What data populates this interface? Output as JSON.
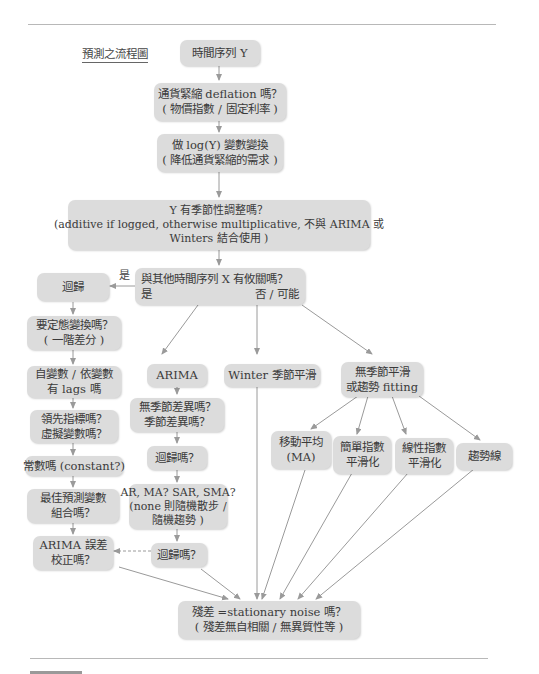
{
  "title": "預測之流程圖",
  "colors": {
    "box_fill": "#dcdcdc",
    "line": "#9a9a9a",
    "text": "#3a3a3a"
  },
  "nodes": {
    "start": {
      "lines": [
        "時間序列 Y"
      ]
    },
    "deflation": {
      "lines": [
        "通貨緊縮 deflation 嗎？",
        "( 物價指數 / 固定利率 )"
      ]
    },
    "log": {
      "lines": [
        "做 log(Y) 變數變換",
        "( 降低通貨緊縮的需求 )"
      ]
    },
    "seasonal": {
      "lines": [
        "Y 有季節性調整嗎？",
        "(additive if logged, otherwise multiplicative, 不與 ARIMA 或",
        "Winters 結合使用 )"
      ]
    },
    "related": {
      "line1": "與其他時間序列 X 有攸關嗎？",
      "yes": "是",
      "no": "否 / 可能"
    },
    "regression": {
      "lines": [
        "迴歸"
      ]
    },
    "stationary_transform": {
      "lines": [
        "要定態變換嗎？",
        "( 一階差分 )"
      ]
    },
    "lags": {
      "lines": [
        "自變數 / 依變數",
        "有 lags 嗎"
      ]
    },
    "leading": {
      "lines": [
        "領先指標嗎？",
        "虛擬變數嗎？"
      ]
    },
    "constant": {
      "lines": [
        "常數嗎 (constant?)"
      ]
    },
    "best_vars": {
      "lines": [
        "最佳預測變數",
        "組合嗎？"
      ]
    },
    "arima_error": {
      "lines": [
        "ARIMA 誤差",
        "校正嗎？"
      ]
    },
    "arima": {
      "lines": [
        "ARIMA"
      ]
    },
    "seasonal_diff": {
      "lines": [
        "無季節差異嗎？",
        "季節差異嗎？"
      ]
    },
    "regress_q1": {
      "lines": [
        "迴歸嗎？"
      ]
    },
    "ar_ma": {
      "lines": [
        "AR, MA? SAR, SMA?",
        "(none 則隨機散步 /",
        "隨機趨勢 )"
      ]
    },
    "regress_q2": {
      "lines": [
        "迴歸嗎？"
      ]
    },
    "winter": {
      "lines": [
        "Winter 季節平滑"
      ]
    },
    "nonseasonal": {
      "lines": [
        "無季節平滑",
        "或趨勢 fitting"
      ]
    },
    "ma": {
      "lines": [
        "移動平均",
        "(MA)"
      ]
    },
    "simple_exp": {
      "lines": [
        "簡單指數",
        "平滑化"
      ]
    },
    "linear_exp": {
      "lines": [
        "線性指數",
        "平滑化"
      ]
    },
    "trend": {
      "lines": [
        "趨勢線"
      ]
    },
    "residual": {
      "lines": [
        "殘差 =stationary noise 嗎？",
        "( 殘差無自相關 / 無異質性等 )"
      ]
    }
  },
  "edge_labels": {
    "yes_left": "是"
  }
}
